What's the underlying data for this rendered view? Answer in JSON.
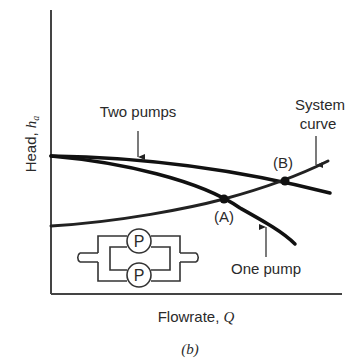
{
  "figure": {
    "caption": "(b)",
    "colors": {
      "curve": "#111111",
      "axis": "#444444",
      "text": "#2a2a2a",
      "background": "#ffffff"
    }
  },
  "axes": {
    "y_label_text": "Head, ",
    "y_label_symbol": "h",
    "y_label_subscript": "a",
    "x_label_text": "Flowrate, ",
    "x_label_symbol": "Q"
  },
  "labels": {
    "two_pumps": "Two pumps",
    "one_pump": "One pump",
    "system_line1": "System",
    "system_line2": "curve",
    "point_a": "(A)",
    "point_b": "(B)"
  },
  "schematic": {
    "pump_top_label": "P",
    "pump_bottom_label": "P"
  },
  "curves": [
    {
      "name": "Two pumps",
      "description": "parallel pump head curve, starts at shutoff head, declines slowly"
    },
    {
      "name": "One pump",
      "description": "single pump head curve, same shutoff head, declines steeply"
    },
    {
      "name": "System curve",
      "description": "rising system head curve"
    }
  ],
  "operating_points": [
    {
      "label": "(A)",
      "meaning": "system curve ∩ one pump"
    },
    {
      "label": "(B)",
      "meaning": "system curve ∩ two pumps"
    }
  ]
}
